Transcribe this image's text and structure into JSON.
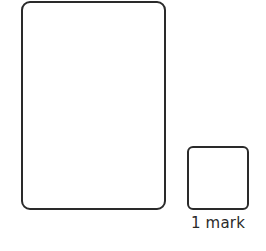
{
  "answer_area": {
    "working_box": {},
    "answer_box": {},
    "marks_label": "1 mark"
  },
  "colors": {
    "border": "#2a2a2a",
    "background": "#ffffff"
  }
}
